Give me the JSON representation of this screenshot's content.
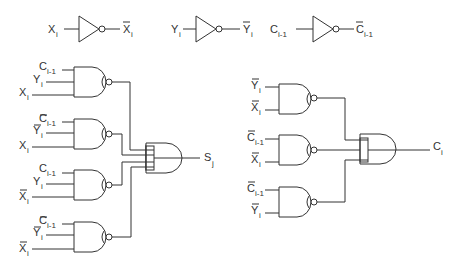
{
  "inverters": [
    {
      "input": "X",
      "input_sub": "i",
      "output": "X",
      "output_sub": "i",
      "output_bar": true
    },
    {
      "input": "Y",
      "input_sub": "i",
      "output": "Y",
      "output_sub": "i",
      "output_bar": true
    },
    {
      "input": "C",
      "input_sub": "i-1",
      "output": "C",
      "output_sub": "i-1",
      "output_bar": true
    }
  ],
  "sum_circuit": {
    "output": {
      "name": "S",
      "sub": "j"
    },
    "gates": [
      {
        "inputs": [
          {
            "name": "C",
            "sub": "i-1",
            "bar": false
          },
          {
            "name": "Y",
            "sub": "i",
            "bar": false
          },
          {
            "name": "X",
            "sub": "i",
            "bar": false
          }
        ]
      },
      {
        "inputs": [
          {
            "name": "C",
            "sub": "i-1",
            "bar": true
          },
          {
            "name": "Y",
            "sub": "i",
            "bar": true
          },
          {
            "name": "X",
            "sub": "i",
            "bar": false
          }
        ]
      },
      {
        "inputs": [
          {
            "name": "C",
            "sub": "i-1",
            "bar": false
          },
          {
            "name": "Y",
            "sub": "i",
            "bar": false
          },
          {
            "name": "X",
            "sub": "i",
            "bar": true
          }
        ]
      },
      {
        "inputs": [
          {
            "name": "C",
            "sub": "i-1",
            "bar": true
          },
          {
            "name": "Y",
            "sub": "i",
            "bar": true
          },
          {
            "name": "X",
            "sub": "i",
            "bar": true
          }
        ]
      }
    ]
  },
  "carry_circuit": {
    "output": {
      "name": "C",
      "sub": "i"
    },
    "gates": [
      {
        "inputs": [
          {
            "name": "Y",
            "sub": "i",
            "bar": true
          },
          {
            "name": "X",
            "sub": "i",
            "bar": true
          }
        ]
      },
      {
        "inputs": [
          {
            "name": "C",
            "sub": "i-1",
            "bar": true
          },
          {
            "name": "X",
            "sub": "i",
            "bar": true
          }
        ]
      },
      {
        "inputs": [
          {
            "name": "C",
            "sub": "i-1",
            "bar": true
          },
          {
            "name": "Y",
            "sub": "i",
            "bar": true
          }
        ]
      }
    ]
  }
}
